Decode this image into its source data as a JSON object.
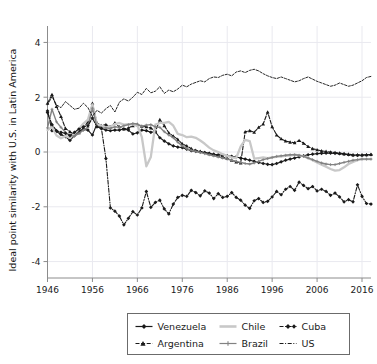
{
  "chart_data": {
    "type": "line",
    "title": "",
    "xlabel": "",
    "ylabel": "Ideal point similarity with U.S. in Latin America",
    "xlim": [
      1946,
      2018
    ],
    "ylim": [
      -4.6,
      4.6
    ],
    "xticks": [
      1946,
      1956,
      1966,
      1976,
      1986,
      1996,
      2006,
      2016
    ],
    "yticks": [
      4,
      2,
      0,
      -2,
      -4
    ],
    "grid": true,
    "legend_position": "bottom-center",
    "series": [
      {
        "name": "Venezuela",
        "color": "#1a1a1a",
        "linestyle": "solid",
        "marker": "diamond",
        "x": [
          1946,
          1947,
          1948,
          1949,
          1950,
          1951,
          1952,
          1953,
          1954,
          1955,
          1956,
          1957,
          1958,
          1959,
          1960,
          1961,
          1962,
          1963,
          1964,
          1965,
          1966,
          1967,
          1968,
          1969,
          1970,
          1971,
          1972,
          1973,
          1974,
          1975,
          1976,
          1977,
          1978,
          1979,
          1980,
          1981,
          1982,
          1983,
          1984,
          1985,
          1986,
          1987,
          1988,
          1989,
          1990,
          1991,
          1992,
          1993,
          1994,
          1995,
          1996,
          1997,
          1998,
          1999,
          2000,
          2001,
          2002,
          2003,
          2004,
          2005,
          2006,
          2007,
          2008,
          2009,
          2010,
          2011,
          2012,
          2013,
          2014,
          2015,
          2016,
          2017,
          2018
        ],
        "y": [
          1.5,
          0.78,
          0.75,
          0.64,
          0.56,
          0.42,
          0.6,
          0.78,
          0.82,
          0.8,
          0.62,
          1.02,
          0.86,
          0.8,
          0.78,
          0.8,
          0.8,
          0.84,
          0.8,
          0.66,
          0.7,
          0.8,
          0.78,
          0.72,
          0.74,
          0.52,
          0.4,
          0.3,
          0.22,
          0.18,
          0.16,
          0.1,
          0.05,
          0.02,
          0.0,
          -0.02,
          -0.05,
          -0.08,
          -0.1,
          -0.12,
          -0.14,
          -0.16,
          -0.18,
          -0.22,
          -0.26,
          -0.3,
          -0.34,
          -0.38,
          -0.42,
          -0.45,
          -0.46,
          -0.42,
          -0.36,
          -0.3,
          -0.26,
          -0.22,
          -0.18,
          -0.14,
          -0.1,
          -0.08,
          -0.06,
          -0.05,
          -0.04,
          -0.04,
          -0.05,
          -0.06,
          -0.08,
          -0.1,
          -0.12,
          -0.12,
          -0.12,
          -0.11,
          -0.1
        ]
      },
      {
        "name": "Argentina",
        "color": "#1a1a1a",
        "linestyle": "dashed",
        "marker": "triangle",
        "x": [
          1946,
          1947,
          1948,
          1949,
          1950,
          1951,
          1952,
          1953,
          1954,
          1955,
          1956,
          1957,
          1958,
          1959,
          1960,
          1961,
          1962,
          1963,
          1964,
          1965,
          1966,
          1967,
          1968,
          1969,
          1970,
          1971,
          1972,
          1973,
          1974,
          1975,
          1976,
          1977,
          1978,
          1979,
          1980,
          1981,
          1982,
          1983,
          1984,
          1985,
          1986,
          1987,
          1988,
          1989,
          1990,
          1991,
          1992,
          1993,
          1994,
          1995,
          1996,
          1997,
          1998,
          1999,
          2000,
          2001,
          2002,
          2003,
          2004,
          2005,
          2006,
          2007,
          2008,
          2009,
          2010,
          2011,
          2012,
          2013,
          2014,
          2015,
          2016,
          2017,
          2018
        ],
        "y": [
          1.78,
          2.1,
          1.66,
          1.3,
          0.86,
          0.74,
          0.64,
          0.7,
          0.88,
          1.1,
          1.78,
          1.06,
          0.96,
          1.0,
          0.92,
          1.06,
          0.92,
          0.84,
          0.88,
          0.96,
          1.0,
          0.94,
          0.92,
          0.88,
          0.74,
          1.18,
          0.96,
          0.7,
          0.58,
          0.46,
          0.3,
          0.22,
          0.12,
          0.06,
          0.02,
          -0.02,
          -0.06,
          -0.1,
          -0.14,
          -0.18,
          -0.24,
          -0.3,
          -0.36,
          -0.4,
          0.74,
          0.78,
          0.72,
          0.9,
          1.02,
          1.46,
          0.92,
          0.62,
          0.48,
          0.4,
          0.36,
          0.34,
          0.42,
          0.32,
          0.2,
          0.12,
          0.08,
          0.04,
          0.02,
          0.0,
          -0.02,
          -0.04,
          -0.06,
          -0.08,
          -0.1,
          -0.1,
          -0.1,
          -0.1,
          -0.09
        ]
      },
      {
        "name": "Chile",
        "color": "#c8c8c8",
        "linestyle": "solid",
        "marker": "none",
        "x": [
          1946,
          1947,
          1948,
          1949,
          1950,
          1951,
          1952,
          1953,
          1954,
          1955,
          1956,
          1957,
          1958,
          1959,
          1960,
          1961,
          1962,
          1963,
          1964,
          1965,
          1966,
          1967,
          1968,
          1969,
          1970,
          1971,
          1972,
          1973,
          1974,
          1975,
          1976,
          1977,
          1978,
          1979,
          1980,
          1981,
          1982,
          1983,
          1984,
          1985,
          1986,
          1987,
          1988,
          1989,
          1990,
          1991,
          1992,
          1993,
          1994,
          1995,
          1996,
          1997,
          1998,
          1999,
          2000,
          2001,
          2002,
          2003,
          2004,
          2005,
          2006,
          2007,
          2008,
          2009,
          2010,
          2011,
          2012,
          2013,
          2014,
          2015,
          2016,
          2017,
          2018
        ],
        "y": [
          0.8,
          0.92,
          0.6,
          0.5,
          0.58,
          0.52,
          0.66,
          0.84,
          1.04,
          1.18,
          1.74,
          1.0,
          0.96,
          0.9,
          0.92,
          1.02,
          1.06,
          1.0,
          1.02,
          1.0,
          0.98,
          0.54,
          -0.52,
          -0.18,
          1.0,
          1.06,
          1.06,
          1.1,
          0.96,
          0.66,
          0.62,
          0.54,
          0.56,
          0.52,
          0.42,
          0.3,
          0.16,
          0.06,
          0.0,
          -0.08,
          -0.14,
          -0.2,
          -0.22,
          0.2,
          0.44,
          0.4,
          -0.24,
          -0.22,
          -0.2,
          -0.22,
          -0.2,
          -0.18,
          -0.16,
          -0.14,
          -0.12,
          -0.1,
          -0.12,
          -0.16,
          -0.22,
          -0.3,
          -0.38,
          -0.46,
          -0.54,
          -0.62,
          -0.68,
          -0.66,
          -0.56,
          -0.44,
          -0.36,
          -0.3,
          -0.26,
          -0.26,
          -0.26
        ]
      },
      {
        "name": "Brazil",
        "color": "#828282",
        "linestyle": "solid",
        "marker": "plus",
        "x": [
          1946,
          1947,
          1948,
          1949,
          1950,
          1951,
          1952,
          1953,
          1954,
          1955,
          1956,
          1957,
          1958,
          1959,
          1960,
          1961,
          1962,
          1963,
          1964,
          1965,
          1966,
          1967,
          1968,
          1969,
          1970,
          1971,
          1972,
          1973,
          1974,
          1975,
          1976,
          1977,
          1978,
          1979,
          1980,
          1981,
          1982,
          1983,
          1984,
          1985,
          1986,
          1987,
          1988,
          1989,
          1990,
          1991,
          1992,
          1993,
          1994,
          1995,
          1996,
          1997,
          1998,
          1999,
          2000,
          2001,
          2002,
          2003,
          2004,
          2005,
          2006,
          2007,
          2008,
          2009,
          2010,
          2011,
          2012,
          2013,
          2014,
          2015,
          2016,
          2017,
          2018
        ],
        "y": [
          0.88,
          1.56,
          1.1,
          0.9,
          0.72,
          0.6,
          0.58,
          0.68,
          0.8,
          0.9,
          1.6,
          0.94,
          0.86,
          0.88,
          0.86,
          0.92,
          0.9,
          0.96,
          1.0,
          1.04,
          1.02,
          0.94,
          0.98,
          1.0,
          0.92,
          0.9,
          0.74,
          0.62,
          0.52,
          0.36,
          0.22,
          0.12,
          0.06,
          0.02,
          -0.02,
          -0.06,
          -0.1,
          -0.14,
          -0.18,
          -0.22,
          -0.26,
          -0.3,
          -0.34,
          -0.38,
          -0.42,
          -0.44,
          -0.4,
          -0.34,
          -0.28,
          -0.24,
          -0.2,
          -0.16,
          -0.14,
          -0.12,
          -0.1,
          -0.1,
          -0.12,
          -0.16,
          -0.22,
          -0.28,
          -0.34,
          -0.4,
          -0.44,
          -0.46,
          -0.46,
          -0.42,
          -0.38,
          -0.34,
          -0.3,
          -0.28,
          -0.26,
          -0.26,
          -0.26
        ]
      },
      {
        "name": "Cuba",
        "color": "#1a1a1a",
        "linestyle": "dash-dot",
        "marker": "diamond",
        "x": [
          1946,
          1947,
          1948,
          1949,
          1950,
          1951,
          1952,
          1953,
          1954,
          1955,
          1956,
          1957,
          1958,
          1959,
          1960,
          1961,
          1962,
          1963,
          1964,
          1965,
          1966,
          1967,
          1968,
          1969,
          1970,
          1971,
          1972,
          1973,
          1974,
          1975,
          1976,
          1977,
          1978,
          1979,
          1980,
          1981,
          1982,
          1983,
          1984,
          1985,
          1986,
          1987,
          1988,
          1989,
          1990,
          1991,
          1992,
          1993,
          1994,
          1995,
          1996,
          1997,
          1998,
          1999,
          2000,
          2001,
          2002,
          2003,
          2004,
          2005,
          2006,
          2007,
          2008,
          2009,
          2010,
          2011,
          2012,
          2013,
          2014,
          2015,
          2016,
          2017,
          2018
        ],
        "y": [
          1.44,
          1.0,
          0.78,
          0.72,
          0.68,
          0.6,
          0.72,
          0.84,
          0.92,
          0.96,
          1.24,
          0.92,
          0.86,
          -0.24,
          -2.04,
          -2.16,
          -2.34,
          -2.66,
          -2.42,
          -2.18,
          -2.3,
          -2.04,
          -1.44,
          -2.02,
          -1.84,
          -1.76,
          -2.08,
          -2.26,
          -1.9,
          -1.66,
          -1.58,
          -1.62,
          -1.4,
          -1.48,
          -1.6,
          -1.42,
          -1.5,
          -1.7,
          -1.52,
          -1.66,
          -1.62,
          -1.48,
          -1.66,
          -1.76,
          -1.94,
          -2.06,
          -1.78,
          -1.7,
          -1.84,
          -1.8,
          -1.64,
          -1.44,
          -1.56,
          -1.36,
          -1.26,
          -1.4,
          -1.1,
          -1.22,
          -1.34,
          -1.26,
          -1.42,
          -1.36,
          -1.44,
          -1.58,
          -1.5,
          -1.64,
          -1.82,
          -1.74,
          -1.82,
          -1.2,
          -1.62,
          -1.88,
          -1.9
        ]
      },
      {
        "name": "US",
        "color": "#1a1a1a",
        "linestyle": "fine-dash",
        "marker": "none",
        "x": [
          1946,
          1947,
          1948,
          1949,
          1950,
          1951,
          1952,
          1953,
          1954,
          1955,
          1956,
          1957,
          1958,
          1959,
          1960,
          1961,
          1962,
          1963,
          1964,
          1965,
          1966,
          1967,
          1968,
          1969,
          1970,
          1971,
          1972,
          1973,
          1974,
          1975,
          1976,
          1977,
          1978,
          1979,
          1980,
          1981,
          1982,
          1983,
          1984,
          1985,
          1986,
          1987,
          1988,
          1989,
          1990,
          1991,
          1992,
          1993,
          1994,
          1995,
          1996,
          1997,
          1998,
          1999,
          2000,
          2001,
          2002,
          2003,
          2004,
          2005,
          2006,
          2007,
          2008,
          2009,
          2010,
          2011,
          2012,
          2013,
          2014,
          2015,
          2016,
          2017,
          2018
        ],
        "y": [
          1.72,
          2.02,
          1.72,
          1.62,
          1.84,
          1.7,
          1.56,
          1.6,
          1.78,
          1.62,
          1.3,
          1.52,
          1.42,
          1.58,
          1.7,
          1.46,
          1.82,
          1.94,
          1.86,
          2.0,
          2.18,
          2.1,
          2.32,
          2.16,
          2.22,
          2.38,
          2.14,
          2.26,
          2.2,
          2.3,
          2.44,
          2.38,
          2.48,
          2.54,
          2.6,
          2.56,
          2.68,
          2.74,
          2.72,
          2.8,
          2.84,
          2.78,
          2.92,
          2.96,
          2.9,
          2.98,
          3.02,
          2.96,
          2.86,
          2.78,
          2.72,
          2.68,
          2.74,
          2.68,
          2.62,
          2.56,
          2.6,
          2.68,
          2.74,
          2.66,
          2.58,
          2.52,
          2.46,
          2.4,
          2.44,
          2.52,
          2.46,
          2.4,
          2.44,
          2.52,
          2.6,
          2.72,
          2.76
        ]
      }
    ]
  },
  "axes": {
    "ylabel": "Ideal point similarity with U.S. in Latin America",
    "ytick_labels": [
      "4",
      "2",
      "0",
      "-2",
      "-4"
    ],
    "xtick_labels": [
      "1946",
      "1956",
      "1966",
      "1976",
      "1986",
      "1996",
      "2006",
      "2016"
    ]
  },
  "legend": {
    "entries": [
      {
        "label": "Venezuela",
        "style": "solid-diamond",
        "color": "#1a1a1a"
      },
      {
        "label": "Chile",
        "style": "solid-light",
        "color": "#c8c8c8"
      },
      {
        "label": "Cuba",
        "style": "dashdot-diamond",
        "color": "#1a1a1a"
      },
      {
        "label": "Argentina",
        "style": "dashed-triangle",
        "color": "#1a1a1a"
      },
      {
        "label": "Brazil",
        "style": "solid-plus",
        "color": "#828282"
      },
      {
        "label": "US",
        "style": "finedash",
        "color": "#1a1a1a"
      }
    ]
  }
}
